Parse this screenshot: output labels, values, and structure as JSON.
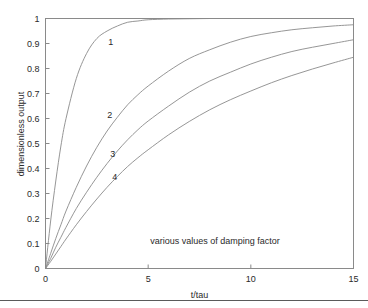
{
  "chart_data": {
    "type": "line",
    "title": "",
    "xlabel": "t/tau",
    "ylabel": "dimensionless output",
    "annotation": "various values of damping factor",
    "xlim": [
      0,
      15
    ],
    "ylim": [
      0,
      1
    ],
    "grid": false,
    "legend": "inline curve labels",
    "xticks": [
      0,
      5,
      10,
      15
    ],
    "xtick_labels": [
      "0",
      "5",
      "10",
      "15"
    ],
    "yticks": [
      0,
      0.1,
      0.2,
      0.3,
      0.4,
      0.5,
      0.6,
      0.7,
      0.8,
      0.9,
      1
    ],
    "ytick_labels": [
      "0",
      "0.1",
      "0.2",
      "0.3",
      "0.4",
      "0.5",
      "0.6",
      "0.7",
      "0.8",
      "0.9",
      "1"
    ],
    "line_color": "#8a8a8a",
    "axis_color": "#8a8a8a",
    "x": [
      0,
      0.25,
      0.5,
      0.75,
      1,
      1.5,
      2,
      2.5,
      3,
      3.5,
      4,
      4.5,
      5,
      6,
      7,
      8,
      9,
      10,
      11,
      12,
      13,
      14,
      15
    ],
    "series": [
      {
        "name": "1",
        "label": "1",
        "label_x": 3.2,
        "label_y": 0.905,
        "values": [
          0,
          0.19,
          0.35,
          0.49,
          0.6,
          0.76,
          0.86,
          0.92,
          0.95,
          0.97,
          0.985,
          0.99,
          0.995,
          0.998,
          0.999,
          1.0,
          1.0,
          1.0,
          1.0,
          1.0,
          1.0,
          1.0,
          1.0
        ]
      },
      {
        "name": "2",
        "label": "2",
        "label_x": 3.15,
        "label_y": 0.615,
        "values": [
          0,
          0.06,
          0.12,
          0.175,
          0.23,
          0.325,
          0.41,
          0.485,
          0.55,
          0.605,
          0.655,
          0.695,
          0.73,
          0.79,
          0.84,
          0.875,
          0.905,
          0.928,
          0.943,
          0.955,
          0.963,
          0.97,
          0.975
        ]
      },
      {
        "name": "3",
        "label": "3",
        "label_x": 3.3,
        "label_y": 0.46,
        "values": [
          0,
          0.04,
          0.085,
          0.125,
          0.165,
          0.24,
          0.305,
          0.365,
          0.42,
          0.47,
          0.515,
          0.555,
          0.59,
          0.65,
          0.705,
          0.75,
          0.785,
          0.818,
          0.845,
          0.868,
          0.885,
          0.9,
          0.915
        ]
      },
      {
        "name": "4",
        "label": "4",
        "label_x": 3.4,
        "label_y": 0.365,
        "values": [
          0,
          0.028,
          0.058,
          0.088,
          0.118,
          0.175,
          0.228,
          0.278,
          0.325,
          0.368,
          0.408,
          0.443,
          0.475,
          0.535,
          0.588,
          0.635,
          0.675,
          0.71,
          0.743,
          0.772,
          0.798,
          0.822,
          0.845
        ]
      }
    ]
  }
}
